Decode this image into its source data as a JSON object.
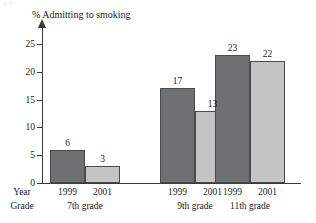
{
  "corner_mark": "2.7",
  "chart_data": {
    "type": "bar",
    "title": "% Admitting to smoking",
    "xlabel": "",
    "ylabel": "",
    "ylim": [
      0,
      27
    ],
    "grid": false,
    "legend": "none",
    "y_ticks": [
      "0",
      "5",
      "10",
      "15",
      "20",
      "25"
    ],
    "y_tick_values": [
      0,
      5,
      10,
      15,
      20,
      25
    ],
    "row_headers": {
      "year": "Year",
      "grade": "Grade"
    },
    "categories": [
      "7th grade",
      "9th grade",
      "11th grade"
    ],
    "series": [
      {
        "name": "1999",
        "values": [
          6,
          17,
          23
        ]
      },
      {
        "name": "2001",
        "values": [
          3,
          13,
          22
        ]
      }
    ],
    "bars": [
      {
        "group": "7th grade",
        "year": "1999",
        "value": 6,
        "label": "6",
        "shade": "dark"
      },
      {
        "group": "7th grade",
        "year": "2001",
        "value": 3,
        "label": "3",
        "shade": "light"
      },
      {
        "group": "9th grade",
        "year": "1999",
        "value": 17,
        "label": "17",
        "shade": "dark"
      },
      {
        "group": "9th grade",
        "year": "2001",
        "value": 13,
        "label": "13",
        "shade": "light"
      },
      {
        "group": "11th grade",
        "year": "1999",
        "value": 23,
        "label": "23",
        "shade": "dark"
      },
      {
        "group": "11th grade",
        "year": "2001",
        "value": 22,
        "label": "22",
        "shade": "light"
      }
    ],
    "colors": {
      "dark_bar": "#6f7072",
      "light_bar": "#c3c4c4",
      "bar_outline": "#4a4a4a",
      "axis": "#3a3a3a",
      "text": "#1a1a1a",
      "background": "#ffffff"
    }
  }
}
